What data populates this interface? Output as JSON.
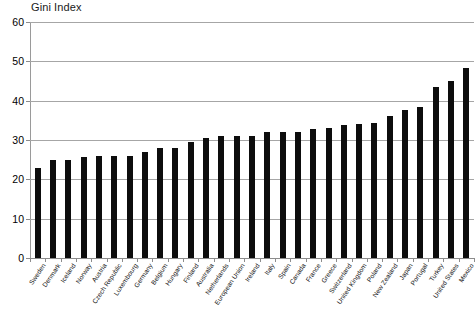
{
  "chart_data": {
    "type": "bar",
    "title": "Gini Index",
    "xlabel": "",
    "ylabel": "",
    "ylim": [
      0,
      60
    ],
    "yticks": [
      0,
      10,
      20,
      30,
      40,
      50,
      60
    ],
    "grid": true,
    "legend": false,
    "bar_color": "#0d0d0d",
    "categories": [
      "Sweden",
      "Denmark",
      "Iceland",
      "Norway",
      "Austria",
      "Czech Republic",
      "Luxembourg",
      "Germany",
      "Belgium",
      "Hungary",
      "Finland",
      "Australia",
      "Netherlands",
      "European Union",
      "Ireland",
      "Italy",
      "Spain",
      "Canada",
      "France",
      "Greece",
      "Switzerland",
      "United Kingdom",
      "Poland",
      "New Zealand",
      "Japan",
      "Portugal",
      "Turkey",
      "United States",
      "Mexico"
    ],
    "values": [
      23.0,
      24.8,
      25.0,
      25.8,
      26.0,
      26.0,
      26.0,
      27.0,
      28.0,
      28.0,
      29.5,
      30.5,
      30.9,
      31.0,
      31.0,
      32.0,
      32.0,
      32.1,
      32.7,
      33.0,
      33.7,
      34.0,
      34.2,
      36.2,
      37.6,
      38.5,
      43.6,
      45.0,
      48.3
    ]
  }
}
